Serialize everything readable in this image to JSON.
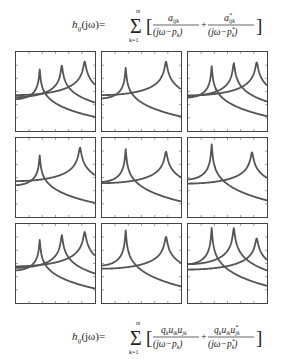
{
  "formula_top": {
    "lhs": "h",
    "lhs_sub": "ij",
    "lhs_arg": "(jω)=",
    "sum_upper": "m",
    "sum_lower": "k=1",
    "term1_num": "a",
    "term1_num_sub": "ijk",
    "term1_den": "(jω−p",
    "term1_den_sub": "k",
    "term1_den_close": ")",
    "plus": "+",
    "term2_num": "a",
    "term2_num_sub": "ijk",
    "term2_num_sup": "*",
    "term2_den": "(jω−p",
    "term2_den_sub": "k",
    "term2_den_sup": "*",
    "term2_den_close": ")"
  },
  "formula_bottom": {
    "lhs": "h",
    "lhs_sub": "ij",
    "lhs_arg": "(jω)=",
    "sum_upper": "m",
    "sum_lower": "k=1",
    "term1_num": "q",
    "term1_num_rest": "u",
    "term1_num_u2": "u",
    "term1_num_subs": [
      "k",
      "ik",
      "jk"
    ],
    "term1_den": "(jω−p",
    "term1_den_sub": "k",
    "term1_den_close": ")",
    "plus": "+",
    "term2_num_subs": [
      "k",
      "ik",
      "jk"
    ],
    "term2_num_sup": "*",
    "term2_den": "(jω−p",
    "term2_den_sub": "k",
    "term2_den_sup": "*",
    "term2_den_close": ")"
  },
  "colors": {
    "curve": "#555555",
    "axis": "#444444",
    "text": "#222222",
    "background": "#ffffff"
  },
  "chart_data": {
    "type": "line",
    "layout": {
      "rows": 3,
      "cols": 3,
      "axes_ticks": true,
      "grid": false
    },
    "panels": [
      {
        "row": 1,
        "col": 1,
        "peaks": [
          {
            "x": 0.3,
            "height": 0.78
          },
          {
            "x": 0.58,
            "height": 0.83
          },
          {
            "x": 0.87,
            "height": 0.88
          }
        ]
      },
      {
        "row": 1,
        "col": 2,
        "peaks": [
          {
            "x": 0.3,
            "height": 0.8
          },
          {
            "x": 0.81,
            "height": 0.88
          }
        ]
      },
      {
        "row": 1,
        "col": 3,
        "peaks": [
          {
            "x": 0.3,
            "height": 0.82
          },
          {
            "x": 0.58,
            "height": 0.86
          },
          {
            "x": 0.87,
            "height": 0.87
          }
        ]
      },
      {
        "row": 2,
        "col": 1,
        "peaks": [
          {
            "x": 0.3,
            "height": 0.78
          },
          {
            "x": 0.81,
            "height": 0.88
          }
        ]
      },
      {
        "row": 2,
        "col": 2,
        "peaks": [
          {
            "x": 0.3,
            "height": 0.86
          },
          {
            "x": 0.81,
            "height": 0.83
          }
        ]
      },
      {
        "row": 2,
        "col": 3,
        "peaks": [
          {
            "x": 0.3,
            "height": 0.92
          },
          {
            "x": 0.81,
            "height": 0.82
          }
        ]
      },
      {
        "row": 3,
        "col": 1,
        "peaks": [
          {
            "x": 0.3,
            "height": 0.8
          },
          {
            "x": 0.58,
            "height": 0.86
          },
          {
            "x": 0.87,
            "height": 0.9
          }
        ]
      },
      {
        "row": 3,
        "col": 2,
        "peaks": [
          {
            "x": 0.3,
            "height": 0.92
          },
          {
            "x": 0.81,
            "height": 0.84
          }
        ]
      },
      {
        "row": 3,
        "col": 3,
        "peaks": [
          {
            "x": 0.3,
            "height": 0.95
          },
          {
            "x": 0.58,
            "height": 0.95
          },
          {
            "x": 0.87,
            "height": 0.82
          }
        ]
      }
    ],
    "xlabel": "",
    "ylabel": ""
  }
}
